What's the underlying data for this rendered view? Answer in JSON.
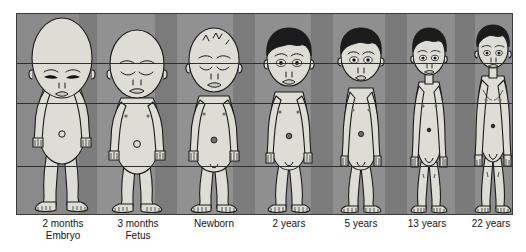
{
  "figure": {
    "panel": {
      "background_color": "#8e8e8e",
      "border_color": "#3a3a3a",
      "reference_lines": 3,
      "reference_line_color": "#2f2f2f"
    },
    "skin_color": "#ddddd6",
    "outline_color": "#1a1a1a",
    "hair_color": "#1c1c1c",
    "stages": [
      {
        "id": "embryo-2-months",
        "label_line1": "2 months",
        "label_line2": "Embryo",
        "head_fraction": "1/2",
        "hair": "none",
        "relative_height_pct": 100
      },
      {
        "id": "fetus-3-months",
        "label_line1": "3 months",
        "label_line2": "Fetus",
        "head_fraction": "1/3",
        "hair": "none",
        "relative_height_pct": 100
      },
      {
        "id": "newborn",
        "label_line1": "Newborn",
        "label_line2": "",
        "head_fraction": "1/4",
        "hair": "sparse",
        "relative_height_pct": 100
      },
      {
        "id": "child-2-years",
        "label_line1": "2 years",
        "label_line2": "",
        "head_fraction": "1/5",
        "hair": "dark",
        "relative_height_pct": 100
      },
      {
        "id": "child-5-years",
        "label_line1": "5 years",
        "label_line2": "",
        "head_fraction": "1/6",
        "hair": "dark",
        "relative_height_pct": 100
      },
      {
        "id": "teen-13-years",
        "label_line1": "13 years",
        "label_line2": "",
        "head_fraction": "1/7",
        "hair": "dark",
        "relative_height_pct": 100
      },
      {
        "id": "adult-22-years",
        "label_line1": "22 years",
        "label_line2": "",
        "head_fraction": "1/8",
        "hair": "dark",
        "relative_height_pct": 100
      }
    ]
  }
}
